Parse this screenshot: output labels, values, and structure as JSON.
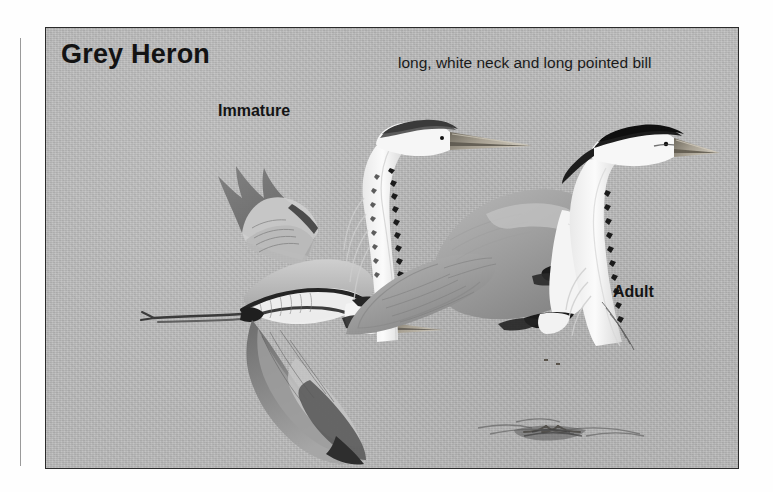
{
  "plate": {
    "title": "Grey Heron",
    "background_color": "#b9b9b9",
    "border_color": "#2b2b2b",
    "labels": {
      "immature": "Immature",
      "adult": "Adult",
      "note": "long, white neck and long pointed bill"
    },
    "figures": [
      {
        "name": "immature-heron-in-flight",
        "pose": "flying",
        "label": "Immature"
      },
      {
        "name": "adult-head-neck-detail",
        "pose": "head and neck close-up",
        "label": ""
      },
      {
        "name": "adult-heron-standing",
        "pose": "standing",
        "label": "Adult"
      }
    ]
  },
  "colors": {
    "ink_dark": "#1a1a1a",
    "plumage_grey": "#8d8d8d",
    "plumage_dark_grey": "#6a6a6a",
    "plumage_white": "#f2f2f2",
    "bill": "#a9a090",
    "leg": "#8b8375"
  }
}
